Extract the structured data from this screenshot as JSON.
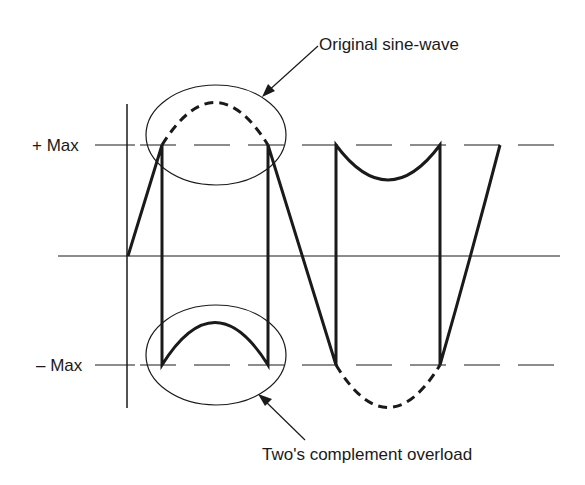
{
  "diagram": {
    "type": "waveform-clipping",
    "labels": {
      "plus_max": "+ Max",
      "minus_max": "– Max",
      "original": "Original sine-wave",
      "overload": "Two's complement overload"
    },
    "colors": {
      "stroke": "#1a1a1a",
      "background": "#ffffff"
    },
    "levels": {
      "plus_max_y": 145,
      "zero_y": 256,
      "minus_max_y": 365
    }
  }
}
